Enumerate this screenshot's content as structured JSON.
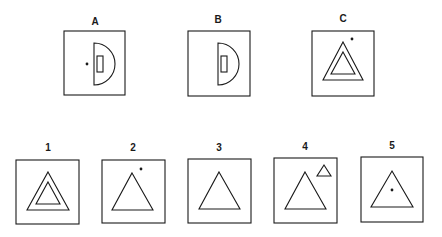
{
  "problem": {
    "top_row": [
      {
        "label": "A",
        "box": [
          64,
          31,
          61,
          64
        ],
        "label_pos": [
          95,
          22
        ]
      },
      {
        "label": "B",
        "box": [
          188,
          31,
          62,
          65
        ],
        "label_pos": [
          218,
          20
        ]
      },
      {
        "label": "C",
        "box": [
          312,
          31,
          62,
          65
        ],
        "label_pos": [
          343,
          19
        ]
      }
    ],
    "options": [
      {
        "label": "1",
        "box": [
          16,
          160,
          63,
          64
        ],
        "label_pos": [
          48,
          148
        ]
      },
      {
        "label": "2",
        "box": [
          102,
          160,
          63,
          63
        ],
        "label_pos": [
          133,
          148
        ]
      },
      {
        "label": "3",
        "box": [
          188,
          159,
          63,
          64
        ],
        "label_pos": [
          219,
          148
        ]
      },
      {
        "label": "4",
        "box": [
          274,
          158,
          63,
          65
        ],
        "label_pos": [
          305,
          147
        ]
      },
      {
        "label": "5",
        "box": [
          361,
          157,
          62,
          65
        ],
        "label_pos": [
          392,
          146
        ]
      }
    ]
  },
  "colors": {
    "stroke": "#1a1a1a",
    "background": "#ffffff"
  }
}
